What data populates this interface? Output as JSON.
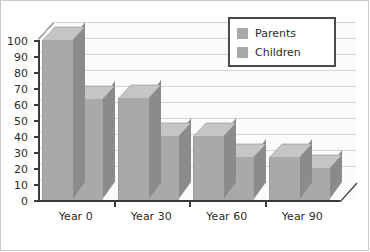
{
  "chart_data": {
    "type": "bar",
    "title": "",
    "xlabel": "",
    "ylabel": "",
    "categories": [
      "Year 0",
      "Year 30",
      "Year 60",
      "Year 90"
    ],
    "series": [
      {
        "name": "Parents",
        "values": [
          100,
          64,
          40,
          27
        ]
      },
      {
        "name": "Children",
        "values": [
          63,
          40,
          27,
          20
        ]
      }
    ],
    "ylim": [
      0,
      100
    ],
    "yticks": [
      0,
      10,
      20,
      30,
      40,
      50,
      60,
      70,
      80,
      90,
      100
    ],
    "ytick_labels": [
      "0",
      "10",
      "20",
      "30",
      "40",
      "50",
      "60",
      "70",
      "80",
      "90",
      "100"
    ],
    "grid": true,
    "legend_position": "top-right",
    "three_d": true,
    "colors": {
      "bar_face": "#a9a9a9",
      "bar_side": "#8b8b8b",
      "bar_top": "#c6c6c6",
      "gridline": "#d4d4d4",
      "axis": "#3a3a3a",
      "wall": "#fbfbfb",
      "legend_border": "#4a4a4a",
      "text": "#2b2b2b"
    }
  },
  "legend": {
    "items": [
      {
        "label": "Parents"
      },
      {
        "label": "Children"
      }
    ]
  }
}
